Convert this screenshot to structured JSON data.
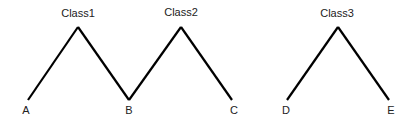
{
  "diagram": {
    "background": "#ffffff",
    "line_color": "#000000",
    "text_color": "#222222",
    "groups": [
      {
        "label": "Class1",
        "peak": {
          "x": 78,
          "y": 27
        },
        "label_pos": {
          "x": 78,
          "y": 17
        },
        "legs": [
          {
            "leaf": "A",
            "x": 28,
            "y": 100,
            "label_pos": {
              "x": 26,
              "y": 114
            }
          },
          {
            "leaf": "B",
            "x": 129,
            "y": 100,
            "label_pos": {
              "x": 129,
              "y": 114
            }
          }
        ]
      },
      {
        "label": "Class2",
        "peak": {
          "x": 181,
          "y": 27
        },
        "label_pos": {
          "x": 181,
          "y": 16
        },
        "legs": [
          {
            "leaf": "B",
            "x": 129,
            "y": 100,
            "label_pos": null
          },
          {
            "leaf": "C",
            "x": 232,
            "y": 100,
            "label_pos": {
              "x": 234,
              "y": 114
            }
          }
        ]
      },
      {
        "label": "Class3",
        "peak": {
          "x": 338,
          "y": 27
        },
        "label_pos": {
          "x": 337,
          "y": 17
        },
        "legs": [
          {
            "leaf": "D",
            "x": 287,
            "y": 100,
            "label_pos": {
              "x": 286,
              "y": 114
            }
          },
          {
            "leaf": "E",
            "x": 389,
            "y": 100,
            "label_pos": {
              "x": 391,
              "y": 114
            }
          }
        ]
      }
    ],
    "leaves": [
      "A",
      "B",
      "C",
      "D",
      "E"
    ],
    "classes": [
      "Class1",
      "Class2",
      "Class3"
    ]
  }
}
